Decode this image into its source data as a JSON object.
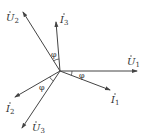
{
  "diagram": {
    "type": "phasor-diagram",
    "origin": [
      60,
      71
    ],
    "phasors": [
      {
        "id": "U1",
        "symbol": "U",
        "sub": "1",
        "end": [
          137,
          71
        ],
        "label_pos": [
          127,
          65
        ]
      },
      {
        "id": "I1",
        "symbol": "I",
        "sub": "1",
        "end": [
          110,
          90
        ],
        "label_pos": [
          111,
          103
        ]
      },
      {
        "id": "I3",
        "symbol": "I",
        "sub": "3",
        "end": [
          56,
          22
        ],
        "label_pos": [
          60,
          23
        ]
      },
      {
        "id": "U2",
        "symbol": "U",
        "sub": "2",
        "end": [
          23,
          12
        ],
        "label_pos": [
          6,
          21
        ]
      },
      {
        "id": "I2",
        "symbol": "I",
        "sub": "2",
        "end": [
          15,
          97
        ],
        "label_pos": [
          6,
          112
        ]
      },
      {
        "id": "U3",
        "symbol": "U",
        "sub": "3",
        "end": [
          22,
          128
        ],
        "label_pos": [
          32,
          131
        ]
      }
    ],
    "angles": [
      {
        "label": "φ",
        "pos": [
          51,
          57
        ],
        "between": [
          "U2",
          "I3"
        ]
      },
      {
        "label": "φ",
        "pos": [
          79,
          78
        ],
        "between": [
          "U1",
          "I1"
        ]
      },
      {
        "label": "φ",
        "pos": [
          39,
          90
        ],
        "between": [
          "U3",
          "I2"
        ]
      }
    ],
    "colors": {
      "line": "#444444",
      "text": "#333333"
    }
  }
}
